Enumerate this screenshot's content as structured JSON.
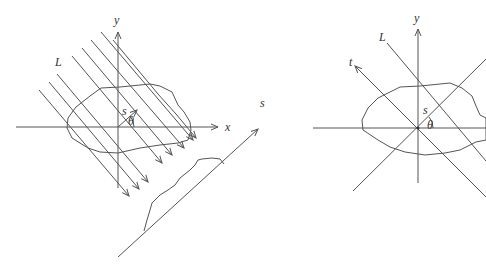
{
  "figures": [
    {
      "name": "parallel-beam-projection",
      "labels": {
        "x_axis": "x",
        "y_axis": "y",
        "line": "L",
        "offset": "s",
        "angle": "θ",
        "projection_axis": "s"
      },
      "num_parallel_lines": 9
    },
    {
      "name": "single-line-geometry",
      "labels": {
        "y_axis": "y",
        "line": "L",
        "t_axis": "t",
        "offset": "s",
        "angle": "θ"
      }
    }
  ],
  "colors": {
    "stroke": "#555555",
    "text": "#333333",
    "background": "#ffffff"
  }
}
